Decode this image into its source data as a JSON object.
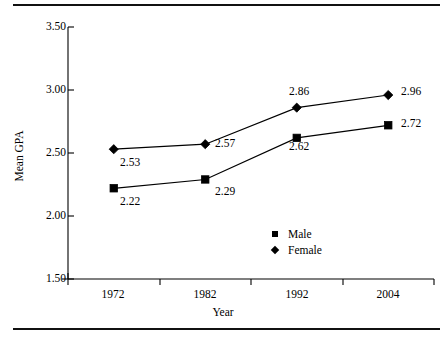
{
  "chart_data": {
    "type": "line",
    "title": "",
    "xlabel": "Year",
    "ylabel": "Mean GPA",
    "categories": [
      "1972",
      "1982",
      "1992",
      "2004"
    ],
    "ylim": [
      1.5,
      3.5
    ],
    "yticks": [
      "1.50",
      "2.00",
      "2.50",
      "3.00",
      "3.50"
    ],
    "ytick_values": [
      1.5,
      2.0,
      2.5,
      3.0,
      3.5
    ],
    "grid": false,
    "legend_position": "inside-bottom-center",
    "series": [
      {
        "name": "Male",
        "marker": "square",
        "color": "#000000",
        "values": [
          2.22,
          2.29,
          2.62,
          2.72
        ],
        "labels": [
          "2.22",
          "2.29",
          "2.62",
          "2.72"
        ]
      },
      {
        "name": "Female",
        "marker": "diamond",
        "color": "#000000",
        "values": [
          2.53,
          2.57,
          2.86,
          2.96
        ],
        "labels": [
          "2.53",
          "2.57",
          "2.86",
          "2.96"
        ]
      }
    ]
  },
  "legend": {
    "items": [
      {
        "label": "Male",
        "marker": "square"
      },
      {
        "label": "Female",
        "marker": "diamond"
      }
    ]
  },
  "axes": {
    "y_title": "Mean GPA",
    "x_title": "Year",
    "y_tick_labels": [
      "3.50",
      "3.00",
      "2.50",
      "2.00",
      "1.50"
    ],
    "x_tick_labels": [
      "1972",
      "1982",
      "1992",
      "2004"
    ]
  }
}
